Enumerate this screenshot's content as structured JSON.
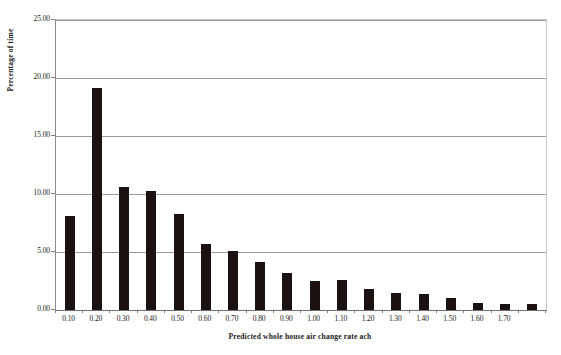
{
  "chart_data": {
    "type": "bar",
    "title": "",
    "xlabel": "Predicted whole house air change rate ach",
    "ylabel": "Percentage of time",
    "categories": [
      "0.10",
      "0.20",
      "0.30",
      "0.40",
      "0.50",
      "0.60",
      "0.70",
      "0.80",
      "0.90",
      "1.00",
      "1.10",
      "1.20",
      "1.30",
      "1.40",
      "1.50",
      "1.60",
      "1.70",
      ""
    ],
    "values": [
      8.1,
      19.1,
      10.6,
      10.3,
      8.3,
      5.7,
      5.1,
      4.1,
      3.2,
      2.5,
      2.6,
      1.8,
      1.5,
      1.4,
      1.0,
      0.6,
      0.5,
      0.5
    ],
    "ylim": [
      0,
      25
    ],
    "yticks": [
      "0.00",
      "5.00",
      "10.00",
      "15.00",
      "20.00",
      "25.00"
    ],
    "ytick_values": [
      0,
      5,
      10,
      15,
      20,
      25
    ],
    "xtick_labels": [
      "0.10",
      "0.20",
      "0.30",
      "0.40",
      "0.50",
      "0.60",
      "0.70",
      "0.80",
      "0.90",
      "1.00",
      "1.10",
      "1.20",
      "1.30",
      "1.40",
      "1.50",
      "1.60",
      "1.70"
    ],
    "grid": "horizontal",
    "legend": "none",
    "bar_color": "#1b1110",
    "gridline_color": "#9a9a9a",
    "plot_border_color": "#c8c8c8",
    "axis_color": "#6f6f6f",
    "background_color": "#ffffff"
  }
}
